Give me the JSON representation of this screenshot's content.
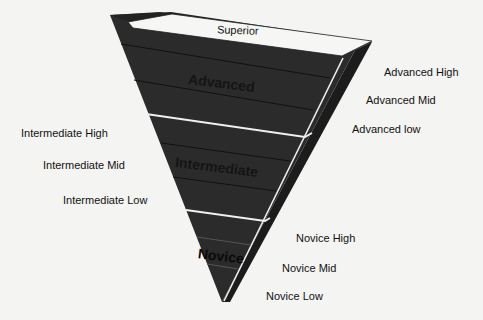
{
  "diagram": {
    "type": "inverted-pyramid",
    "colors": {
      "background": "#f4f4f2",
      "pyramid_fill": "#2b2b2b",
      "side_fill": "#1c1c1c",
      "top_band": "#f6f6f4",
      "divider": "#f0f0f0",
      "sublevel_line": "#111111",
      "text": "#111111"
    },
    "top_band": {
      "label": "Superior"
    },
    "tiers": [
      {
        "label": "Advanced",
        "sublevels": [
          "Advanced High",
          "Advanced Mid",
          "Advanced low"
        ]
      },
      {
        "label": "Intermediate",
        "sublevels": [
          "Intermediate High",
          "Intermediate Mid",
          "Intermediate Low"
        ]
      },
      {
        "label": "Novice",
        "sublevels": [
          "Novice High",
          "Novice Mid",
          "Novice Low"
        ]
      }
    ]
  }
}
